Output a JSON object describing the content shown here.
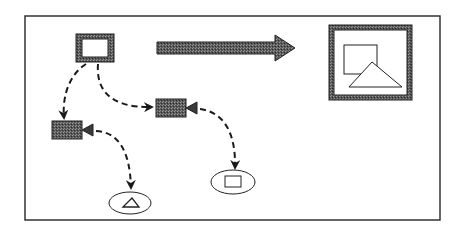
{
  "diagram": {
    "colors": {
      "stroke": "#1a1a1a",
      "fill_dark": "#4a4a4a",
      "background": "#ffffff"
    },
    "nodes": [
      {
        "id": "source-frame",
        "type": "hatched-rectangle"
      },
      {
        "id": "camera-1",
        "type": "camera"
      },
      {
        "id": "camera-2",
        "type": "camera"
      },
      {
        "id": "viewport-triangle",
        "type": "ellipse-with-triangle"
      },
      {
        "id": "viewport-square",
        "type": "ellipse-with-square"
      },
      {
        "id": "result-frame",
        "type": "framed-square-and-triangle"
      }
    ],
    "edges": [
      {
        "from": "source-frame",
        "to": "camera-1",
        "style": "dashed-arrow"
      },
      {
        "from": "source-frame",
        "to": "camera-2",
        "style": "dashed-arrow"
      },
      {
        "from": "camera-1",
        "to": "viewport-triangle",
        "style": "dashed-arrow"
      },
      {
        "from": "camera-2",
        "to": "viewport-square",
        "style": "dashed-arrow"
      },
      {
        "from": "source-frame",
        "to": "result-frame",
        "style": "thick-arrow"
      }
    ]
  }
}
